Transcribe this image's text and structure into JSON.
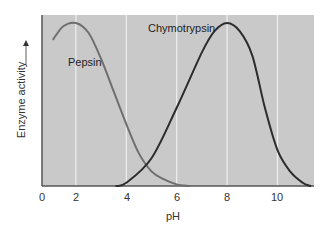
{
  "chart_data": {
    "type": "line",
    "title": "",
    "xlabel": "pH",
    "ylabel": "Enzyme activity",
    "ylabel_arrow": "up",
    "x_ticks": [
      "0",
      "2",
      "4",
      "6",
      "8",
      "10"
    ],
    "xlim": [
      0,
      11.5
    ],
    "ylim": [
      0,
      1
    ],
    "grid": "vertical",
    "background_color": "#c9c9c9",
    "series": [
      {
        "name": "Pepsin",
        "color": "#6f6f6f",
        "label_position": [
          1.5,
          0.72
        ],
        "x": [
          1.1,
          1.5,
          2.0,
          2.5,
          3.0,
          3.5,
          4.0,
          4.5,
          5.0,
          5.5,
          6.0,
          6.5
        ],
        "values": [
          0.9,
          0.98,
          1.0,
          0.94,
          0.78,
          0.58,
          0.38,
          0.2,
          0.09,
          0.04,
          0.01,
          0.0
        ]
      },
      {
        "name": "Chymotrypsin",
        "color": "#2c2c2c",
        "label_position": [
          6.0,
          0.96
        ],
        "x": [
          3.6,
          4.0,
          5.0,
          6.0,
          7.0,
          7.5,
          8.0,
          8.5,
          9.0,
          9.5,
          10.0,
          10.5,
          11.0,
          11.3
        ],
        "values": [
          0.0,
          0.02,
          0.17,
          0.48,
          0.82,
          0.95,
          1.0,
          0.95,
          0.8,
          0.48,
          0.22,
          0.09,
          0.02,
          0.0
        ]
      }
    ]
  }
}
